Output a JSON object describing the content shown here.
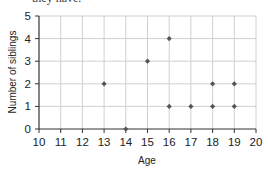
{
  "header": {
    "partial_text": "they have."
  },
  "chart_data": {
    "type": "scatter",
    "title": "",
    "xlabel": "Age",
    "ylabel": "Number of siblings",
    "xlim": [
      10,
      20
    ],
    "ylim": [
      0,
      5
    ],
    "xticks": [
      10,
      11,
      12,
      13,
      14,
      15,
      16,
      17,
      18,
      19,
      20
    ],
    "yticks": [
      0,
      1,
      2,
      3,
      4,
      5
    ],
    "grid": true,
    "legend": null,
    "points": [
      {
        "x": 13,
        "y": 2
      },
      {
        "x": 14,
        "y": 0
      },
      {
        "x": 15,
        "y": 3
      },
      {
        "x": 16,
        "y": 4
      },
      {
        "x": 16,
        "y": 1
      },
      {
        "x": 17,
        "y": 1
      },
      {
        "x": 18,
        "y": 2
      },
      {
        "x": 18,
        "y": 1
      },
      {
        "x": 19,
        "y": 2
      },
      {
        "x": 19,
        "y": 1
      }
    ],
    "colors": {
      "marker": "#555555",
      "grid": "#d0d0d0",
      "axis": "#333333"
    }
  }
}
